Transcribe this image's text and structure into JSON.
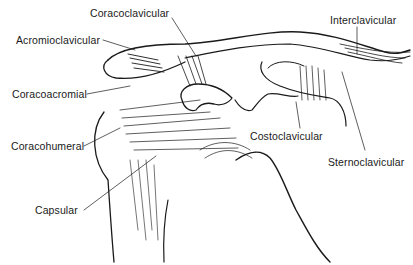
{
  "diagram": {
    "line_color": "#1a1a1a",
    "background": "#ffffff",
    "labels": [
      {
        "id": "coracoclavicular",
        "text": "Coracoclavicular"
      },
      {
        "id": "interclavicular",
        "text": "Interclavicular"
      },
      {
        "id": "acromioclavicular",
        "text": "Acromioclavicular"
      },
      {
        "id": "coracoacromial",
        "text": "Coracoacromial"
      },
      {
        "id": "coracohumeral",
        "text": "Coracohumeral"
      },
      {
        "id": "costoclavicular",
        "text": "Costoclavicular"
      },
      {
        "id": "sternoclavicular",
        "text": "Sternoclavicular"
      },
      {
        "id": "capsular",
        "text": "Capsular"
      }
    ]
  }
}
